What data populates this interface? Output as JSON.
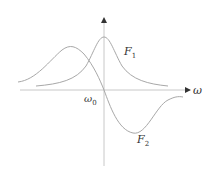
{
  "diagram": {
    "axes": {
      "x_label": "ω",
      "origin_label": "ω",
      "origin_sub": "0"
    },
    "curves": [
      {
        "name": "F",
        "sub": "1",
        "shape": "absorption (Lorentzian peak at ω0)"
      },
      {
        "name": "F",
        "sub": "2",
        "shape": "dispersion (antisymmetric about ω0)"
      }
    ],
    "colors": {
      "axis": "#bbbbbb",
      "curve": "#999999",
      "text": "#333333"
    }
  }
}
